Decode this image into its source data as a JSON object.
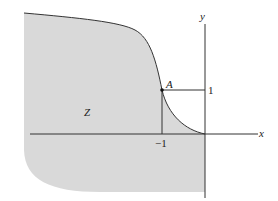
{
  "diagram": {
    "region_label": "Z",
    "point_label": "A",
    "x_axis_label": "x",
    "y_axis_label": "y",
    "x_tick_label": "−1",
    "y_tick_label": "1",
    "colors": {
      "region_fill": "#d9d9d9",
      "stroke": "#333333",
      "background": "#ffffff"
    }
  }
}
